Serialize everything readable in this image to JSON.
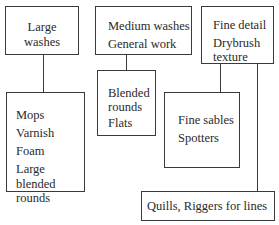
{
  "diagram": {
    "top_boxes": [
      {
        "id": "large-washes",
        "lines": [
          "Large",
          "washes"
        ]
      },
      {
        "id": "medium-washes",
        "lines": [
          "Medium washes",
          "General work"
        ]
      },
      {
        "id": "fine-detail",
        "lines": [
          "Fine detail",
          "Drybrush",
          "texture"
        ]
      }
    ],
    "bottom_boxes": [
      {
        "id": "mops",
        "items": [
          "Mops",
          "Varnish",
          "Foam",
          "Large blended",
          "rounds"
        ]
      },
      {
        "id": "blended-rounds",
        "items": [
          "Blended",
          "rounds",
          "Flats"
        ]
      },
      {
        "id": "fine-sables",
        "items": [
          "Fine sables",
          "Spotters"
        ]
      },
      {
        "id": "quills",
        "items": [
          "Quills, Riggers for lines"
        ]
      }
    ],
    "colors": {
      "stroke": "#3a3a3a",
      "text": "#2a2a2a",
      "background": "#ffffff"
    }
  }
}
